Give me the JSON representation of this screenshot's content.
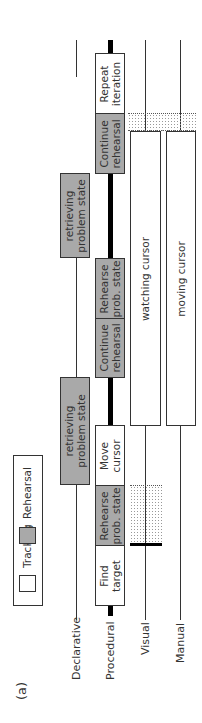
{
  "figure_label": "(a)",
  "legend": {
    "items": [
      {
        "label": "Tracking",
        "color": "#ffffff"
      },
      {
        "label": "Rehearsal",
        "color": "#a9a9a9"
      }
    ]
  },
  "lanes": [
    {
      "label": "Declarative"
    },
    {
      "label": "Procedural"
    },
    {
      "label": "Visual"
    },
    {
      "label": "Manual"
    }
  ],
  "declarative": [
    {
      "label": "retrieving problem state",
      "line1": "retrieving",
      "line2": "problem state"
    },
    {
      "label": "retrieving problem state",
      "line1": "retrieving",
      "line2": "problem state"
    }
  ],
  "procedural": [
    {
      "line1": "Find",
      "line2": "target",
      "type": "tracking"
    },
    {
      "line1": "Rehearse",
      "line2": "prob. state",
      "type": "rehearsal"
    },
    {
      "line1": "Move",
      "line2": "cursor",
      "type": "tracking"
    },
    {
      "line1": "Continue",
      "line2": "rehearsal",
      "type": "rehearsal"
    },
    {
      "line1": "Rehearse",
      "line2": "prob. state",
      "type": "rehearsal"
    },
    {
      "line1": "Continue",
      "line2": "rehearsal",
      "type": "rehearsal"
    },
    {
      "line1": "Repeat",
      "line2": "iteration",
      "type": "tracking"
    }
  ],
  "visual": {
    "label": "watching cursor"
  },
  "manual": {
    "label": "moving cursor"
  },
  "colors": {
    "rehearsal": "#a9a9a9",
    "tracking": "#ffffff",
    "line": "#333333"
  }
}
